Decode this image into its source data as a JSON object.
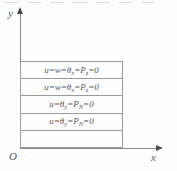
{
  "figure": {
    "colors": {
      "background": "#fdfdfd",
      "rect_lines": "#9b9b9b",
      "axis_lines": "#8a8a8a",
      "arrowheads": "#4a4a4a",
      "text": "#5a5a5a"
    },
    "axes": {
      "y_label": "y",
      "x_label": "x",
      "origin_label": "O"
    },
    "strips": [
      {
        "text": "u=w=θx=Pz=0",
        "parts": [
          {
            "t": "u=w=θ"
          },
          {
            "t": "x",
            "sub": true
          },
          {
            "t": "=P"
          },
          {
            "t": "z",
            "sub": true
          },
          {
            "t": "=0"
          }
        ]
      },
      {
        "text": "u=w=θx=Pz=0",
        "parts": [
          {
            "t": "u=w=θ"
          },
          {
            "t": "x",
            "sub": true
          },
          {
            "t": "=P"
          },
          {
            "t": "z",
            "sub": true
          },
          {
            "t": "=0"
          }
        ]
      },
      {
        "text": "u=θy=PN=0",
        "parts": [
          {
            "t": "u=θ"
          },
          {
            "t": "y",
            "sub": true
          },
          {
            "t": "=P"
          },
          {
            "t": "N",
            "sub": true
          },
          {
            "t": "=0"
          }
        ]
      },
      {
        "text": "u=θy=PN=0",
        "parts": [
          {
            "t": "u=θ"
          },
          {
            "t": "y",
            "sub": true
          },
          {
            "t": "=P"
          },
          {
            "t": "N",
            "sub": true
          },
          {
            "t": "=0"
          }
        ]
      },
      {
        "text": "",
        "parts": []
      }
    ]
  }
}
